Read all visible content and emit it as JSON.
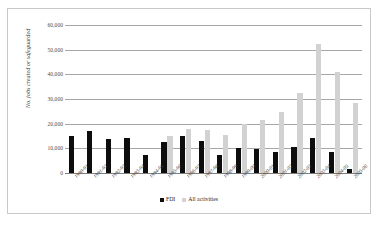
{
  "chart_data": {
    "type": "bar",
    "title": "",
    "xlabel": "",
    "ylabel": "No. jobs created or safeguarded",
    "ylim": [
      0,
      60000
    ],
    "ytick_labels": [
      "60,000",
      "50,000",
      "40,000",
      "30,000",
      "20,000",
      "10,000",
      "0"
    ],
    "ytick_values": [
      60000,
      50000,
      40000,
      30000,
      20000,
      10000,
      0
    ],
    "grid": true,
    "legend_position": "bottom",
    "categories": [
      "1990-91",
      "1991-92",
      "1992-93",
      "1993-94",
      "1994-95",
      "1995-96",
      "1996-97",
      "1997-98",
      "1998-99",
      "1999-00",
      "2000-01",
      "2001-02",
      "2002-03",
      "2003-04",
      "2004-05",
      "2005-06"
    ],
    "series": [
      {
        "name": "FDI",
        "color": "#0d0d0d",
        "values": [
          15100,
          17000,
          13900,
          14000,
          7400,
          12400,
          15100,
          13000,
          7500,
          10000,
          9600,
          8700,
          10500,
          14300,
          8400,
          1800
        ]
      },
      {
        "name": "All activities",
        "color": "#d2d2d2",
        "values": [
          null,
          null,
          null,
          null,
          null,
          14900,
          18000,
          17500,
          15400,
          19800,
          21500,
          24900,
          32500,
          52200,
          40800,
          28500
        ]
      }
    ]
  },
  "legend": {
    "items": [
      {
        "label": "FDI",
        "color": "#0d0d0d"
      },
      {
        "label": "All activities",
        "color": "#d2d2d2"
      }
    ]
  }
}
